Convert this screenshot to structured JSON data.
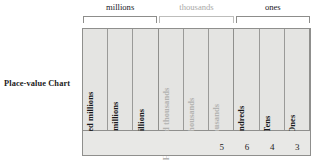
{
  "title": "Place-value Chart",
  "groups": [
    {
      "label": "millions",
      "tone": "dark",
      "span": 3
    },
    {
      "label": "thousands",
      "tone": "light",
      "span": 3
    },
    {
      "label": "ones",
      "tone": "dark",
      "span": 3
    }
  ],
  "columns": [
    {
      "label": "Hundred millions",
      "tone": "dark",
      "digit": ""
    },
    {
      "label": "Ten millions",
      "tone": "dark",
      "digit": ""
    },
    {
      "label": "Millions",
      "tone": "dark",
      "digit": ""
    },
    {
      "label": "Hundred thousands",
      "tone": "light",
      "digit": ""
    },
    {
      "label": "Ten thousands",
      "tone": "light",
      "digit": ""
    },
    {
      "label": "Thousands",
      "tone": "light",
      "digit": "5"
    },
    {
      "label": "Hundreds",
      "tone": "dark",
      "digit": "6"
    },
    {
      "label": "Tens",
      "tone": "dark",
      "digit": "4"
    },
    {
      "label": "Ones",
      "tone": "dark",
      "digit": "3"
    }
  ],
  "colors": {
    "dark_text": "#18181a",
    "light_text": "#b3b3b1",
    "cell_fill": "#e4e4e2",
    "digit_fill": "#e8e8e6",
    "border": "#8f8f8d"
  }
}
